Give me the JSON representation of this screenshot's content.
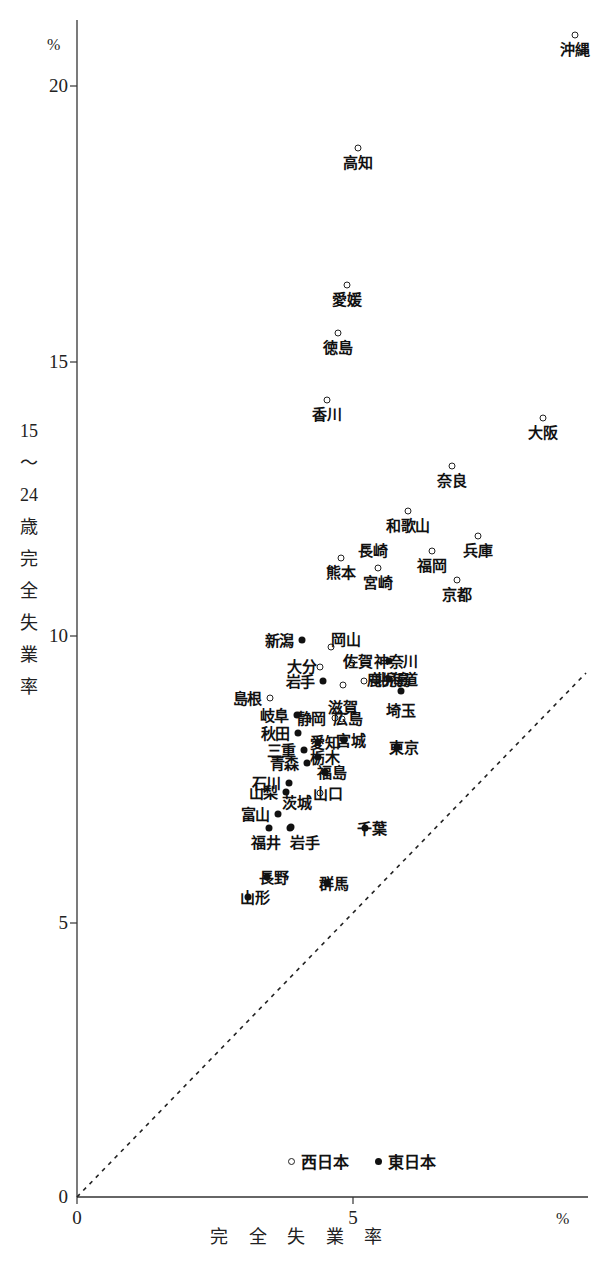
{
  "chart_data": {
    "type": "scatter",
    "title": "",
    "xlabel": "完全失業率",
    "ylabel": "15〜24歳完全失業率",
    "x_unit": "%",
    "y_unit": "%",
    "xlim": [
      0,
      9.3
    ],
    "ylim": [
      0,
      21.7
    ],
    "x_ticks": [
      0,
      5
    ],
    "y_ticks": [
      0,
      5,
      10,
      15,
      20
    ],
    "grid": false,
    "reference_line": {
      "type": "dashed-diagonal",
      "description": "y = x 対角線",
      "from": [
        0,
        0
      ],
      "to": [
        9.2,
        9.2
      ]
    },
    "legend": {
      "position": "bottom-center",
      "entries": [
        {
          "marker": "open-circle",
          "label": "西日本"
        },
        {
          "marker": "filled-circle",
          "label": "東日本"
        }
      ]
    },
    "series": [
      {
        "name": "西日本",
        "marker": "open-circle",
        "points": [
          {
            "label": "沖縄",
            "x": 9.02,
            "y": 21.1,
            "lx": 575,
            "ly": 35,
            "tx": 575,
            "ty": 42,
            "align": "c"
          },
          {
            "label": "高知",
            "x": 5.09,
            "y": 19.45,
            "lx": 358,
            "ly": 148,
            "tx": 358,
            "ty": 155,
            "align": "c"
          },
          {
            "label": "愛媛",
            "x": 4.89,
            "y": 16.95,
            "lx": 347,
            "ly": 285,
            "tx": 347,
            "ty": 292,
            "align": "c"
          },
          {
            "label": "徳島",
            "x": 4.73,
            "y": 16.08,
            "lx": 338,
            "ly": 333,
            "tx": 338,
            "ty": 340,
            "align": "c"
          },
          {
            "label": "香川",
            "x": 4.53,
            "y": 14.86,
            "lx": 327,
            "ly": 400,
            "tx": 327,
            "ty": 407,
            "align": "c"
          },
          {
            "label": "大阪",
            "x": 8.44,
            "y": 14.53,
            "lx": 543,
            "ly": 418,
            "tx": 543,
            "ty": 425,
            "align": "c"
          },
          {
            "label": "奈良",
            "x": 6.79,
            "y": 13.66,
            "lx": 452,
            "ly": 466,
            "tx": 452,
            "ty": 473,
            "align": "c"
          },
          {
            "label": "和歌山",
            "x": 5.99,
            "y": 12.65,
            "lx": 408,
            "ly": 511,
            "tx": 408,
            "ty": 518,
            "align": "c"
          },
          {
            "label": "兵庫",
            "x": 7.26,
            "y": 12.2,
            "lx": 478,
            "ly": 536,
            "tx": 478,
            "ty": 543,
            "align": "c"
          },
          {
            "label": "長崎",
            "x": 5.21,
            "y": 11.94,
            "lx": 365,
            "ly": 550,
            "tx": 373,
            "ty": 543,
            "align": "c"
          },
          {
            "label": "福岡",
            "x": 6.43,
            "y": 11.92,
            "lx": 432,
            "ly": 551,
            "tx": 432,
            "ty": 558,
            "align": "c"
          },
          {
            "label": "熊本",
            "x": 4.78,
            "y": 11.79,
            "lx": 341,
            "ly": 558,
            "tx": 341,
            "ty": 565,
            "align": "c"
          },
          {
            "label": "宮崎",
            "x": 5.45,
            "y": 11.61,
            "lx": 378,
            "ly": 568,
            "tx": 378,
            "ty": 575,
            "align": "c"
          },
          {
            "label": "京都",
            "x": 6.88,
            "y": 11.39,
            "lx": 457,
            "ly": 580,
            "tx": 457,
            "ty": 587,
            "align": "c"
          },
          {
            "label": "岡山",
            "x": 4.6,
            "y": 10.02,
            "lx": 331,
            "ly": 647,
            "tx": 346,
            "ty": 632,
            "align": "c"
          },
          {
            "label": "佐賀",
            "x": 4.98,
            "y": 9.73,
            "lx": 352,
            "ly": 663,
            "tx": 358,
            "ty": 654,
            "align": "c"
          },
          {
            "label": "大分",
            "x": 4.4,
            "y": 9.66,
            "lx": 320,
            "ly": 667,
            "tx": 302,
            "ty": 659,
            "align": "c"
          },
          {
            "label": "鹿児島",
            "x": 5.2,
            "y": 9.4,
            "lx": 364,
            "ly": 681,
            "tx": 389,
            "ty": 672,
            "align": "c"
          },
          {
            "label": "滋賀",
            "x": 4.82,
            "y": 9.33,
            "lx": 343,
            "ly": 685,
            "tx": 343,
            "ty": 700,
            "align": "c"
          },
          {
            "label": "島根",
            "x": 3.5,
            "y": 9.07,
            "lx": 270,
            "ly": 698,
            "tx": 262,
            "ty": 691,
            "align": "r"
          },
          {
            "label": "静岡",
            "x": 4.67,
            "y": 8.71,
            "lx": 335,
            "ly": 718,
            "tx": 326,
            "ty": 711,
            "align": "r"
          },
          {
            "label": "広島",
            "x": 4.8,
            "y": 8.69,
            "lx": 342,
            "ly": 719,
            "tx": 348,
            "ty": 711,
            "align": "c"
          },
          {
            "label": "山口",
            "x": 4.37,
            "y": 7.32,
            "lx": 320,
            "ly": 793,
            "tx": 328,
            "ty": 786,
            "align": "c"
          }
        ]
      },
      {
        "name": "東日本",
        "marker": "filled-circle",
        "points": [
          {
            "label": "新潟",
            "x": 4.08,
            "y": 10.13,
            "lx": 302,
            "ly": 640,
            "tx": 294,
            "ty": 633,
            "align": "r"
          },
          {
            "label": "神奈川",
            "x": 5.66,
            "y": 9.76,
            "lx": 389,
            "ly": 661,
            "tx": 396,
            "ty": 654,
            "align": "c"
          },
          {
            "label": "北海道",
            "x": 5.66,
            "y": 9.43,
            "lx": 389,
            "ly": 679,
            "tx": 396,
            "ty": 672,
            "align": "c"
          },
          {
            "label": "岩手",
            "x": 4.46,
            "y": 9.38,
            "lx": 323,
            "ly": 681,
            "tx": 315,
            "ty": 674,
            "align": "r"
          },
          {
            "label": "埼玉",
            "x": 5.88,
            "y": 9.2,
            "lx": 401,
            "ly": 691,
            "tx": 401,
            "ty": 703,
            "align": "c"
          },
          {
            "label": "岐阜",
            "x": 3.99,
            "y": 8.74,
            "lx": 297,
            "ly": 715,
            "tx": 289,
            "ty": 708,
            "align": "r"
          },
          {
            "label": "宮城",
            "x": 4.84,
            "y": 8.35,
            "lx": 344,
            "ly": 740,
            "tx": 351,
            "ty": 733,
            "align": "c"
          },
          {
            "label": "秋田",
            "x": 4.01,
            "y": 8.41,
            "lx": 298,
            "ly": 733,
            "tx": 290,
            "ty": 726,
            "align": "r"
          },
          {
            "label": "愛知",
            "x": 4.37,
            "y": 8.25,
            "lx": 318,
            "ly": 742,
            "tx": 325,
            "ty": 735,
            "align": "c"
          },
          {
            "label": "三重",
            "x": 4.11,
            "y": 8.11,
            "lx": 304,
            "ly": 750,
            "tx": 296,
            "ty": 743,
            "align": "r"
          },
          {
            "label": "東京",
            "x": 5.8,
            "y": 8.13,
            "lx": 397,
            "ly": 747,
            "tx": 404,
            "ty": 740,
            "align": "c"
          },
          {
            "label": "栃木",
            "x": 4.37,
            "y": 7.98,
            "lx": 318,
            "ly": 757,
            "tx": 325,
            "ty": 750,
            "align": "c"
          },
          {
            "label": "青森",
            "x": 4.17,
            "y": 7.87,
            "lx": 307,
            "ly": 763,
            "tx": 299,
            "ty": 756,
            "align": "r"
          },
          {
            "label": "福島",
            "x": 4.49,
            "y": 7.71,
            "lx": 325,
            "ly": 772,
            "tx": 332,
            "ty": 765,
            "align": "c"
          },
          {
            "label": "石川",
            "x": 3.84,
            "y": 7.51,
            "lx": 289,
            "ly": 783,
            "tx": 281,
            "ty": 776,
            "align": "r"
          },
          {
            "label": "山梨",
            "x": 3.79,
            "y": 7.35,
            "lx": 286,
            "ly": 792,
            "tx": 278,
            "ty": 785,
            "align": "r"
          },
          {
            "label": "富山",
            "x": 3.64,
            "y": 6.97,
            "lx": 278,
            "ly": 814,
            "tx": 270,
            "ty": 807,
            "align": "r"
          },
          {
            "label": "茨城",
            "x": 3.86,
            "y": 6.71,
            "lx": 290,
            "ly": 828,
            "tx": 297,
            "ty": 795,
            "align": "c"
          },
          {
            "label": "福井",
            "x": 3.48,
            "y": 6.71,
            "lx": 269,
            "ly": 828,
            "tx": 266,
            "ty": 835,
            "align": "c"
          },
          {
            "label": "岩手",
            "x": 3.88,
            "y": 6.72,
            "lx": 291,
            "ly": 827,
            "tx": 305,
            "ty": 835,
            "align": "c"
          },
          {
            "label": "千葉",
            "x": 5.22,
            "y": 6.7,
            "lx": 365,
            "ly": 828,
            "tx": 372,
            "ty": 821,
            "align": "c"
          },
          {
            "label": "長野",
            "x": 3.44,
            "y": 5.82,
            "lx": 267,
            "ly": 877,
            "tx": 274,
            "ty": 870,
            "align": "c"
          },
          {
            "label": "群馬",
            "x": 4.53,
            "y": 5.71,
            "lx": 327,
            "ly": 883,
            "tx": 334,
            "ty": 876,
            "align": "c"
          },
          {
            "label": "山形",
            "x": 3.1,
            "y": 5.45,
            "lx": 248,
            "ly": 897,
            "tx": 255,
            "ty": 890,
            "align": "c"
          }
        ]
      }
    ]
  },
  "axes": {
    "y": {
      "unit_label": "%",
      "ticks": [
        {
          "value": "20",
          "px": 86
        },
        {
          "value": "15",
          "px": 362
        },
        {
          "value": "10",
          "px": 636
        },
        {
          "value": "5",
          "px": 923
        },
        {
          "value": "0",
          "px": 1197
        }
      ],
      "title_chars": [
        "15",
        "〜",
        "24",
        "歳",
        "完",
        "全",
        "失",
        "業",
        "率"
      ]
    },
    "x": {
      "unit_label": "%",
      "ticks": [
        {
          "value": "0",
          "px": 77
        },
        {
          "value": "5",
          "px": 353
        }
      ],
      "title": "完 全 失 業 率"
    }
  },
  "legend": {
    "west_label": "西日本",
    "east_label": "東日本"
  },
  "colors": {
    "axis": "#333333",
    "marker_stroke": "#222222",
    "marker_fill": "#111111",
    "text": "#1a1a1a",
    "background": "#ffffff"
  }
}
